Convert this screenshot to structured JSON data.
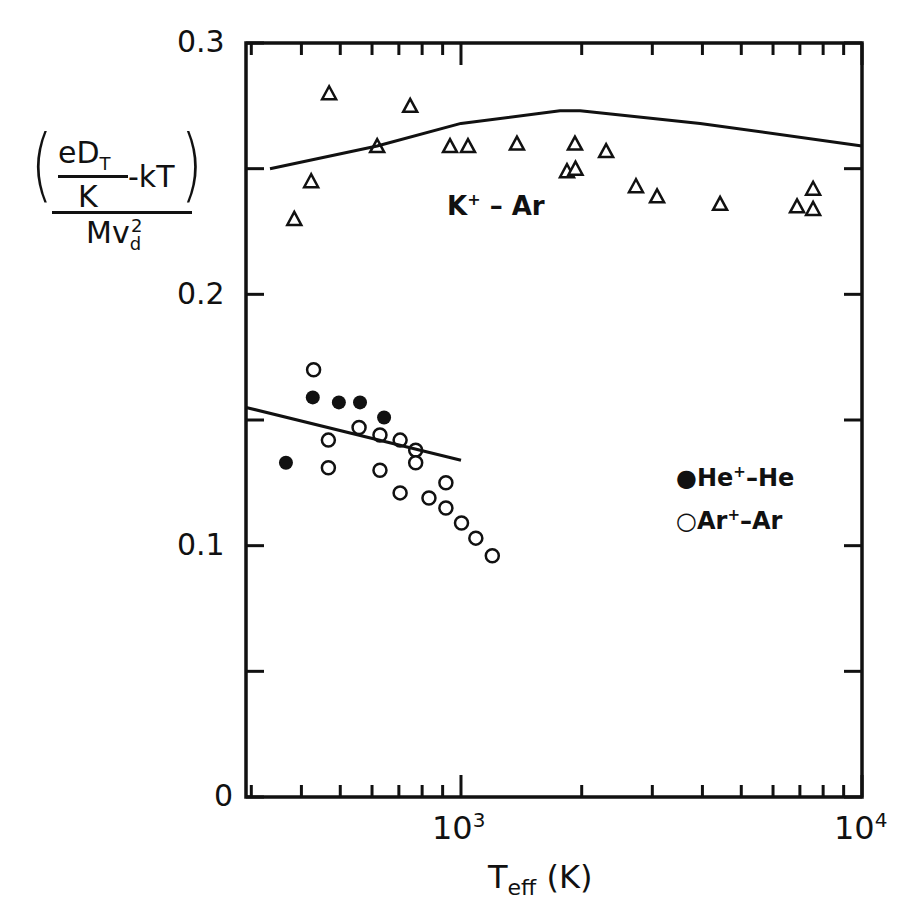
{
  "chart_data": {
    "type": "scatter",
    "title": "",
    "xlabel": "T_eff (K)",
    "ylabel": "(eD_T/K - kT) / (M v_d^2)",
    "xscale": "log",
    "xlim": [
      291,
      10000
    ],
    "ylim": [
      0,
      0.3
    ],
    "x_tick_labels": [
      "10^3",
      "10^4"
    ],
    "y_tick_labels": [
      "0",
      "0.1",
      "0.2",
      "0.3"
    ],
    "grid": false,
    "legend_position": "right-middle",
    "annotations": [
      "K+ - Ar"
    ],
    "series": [
      {
        "name": "K+ - Ar (experiment)",
        "marker": "open-triangle",
        "points": [
          [
            384,
            0.23
          ],
          [
            423,
            0.245
          ],
          [
            469,
            0.28
          ],
          [
            618,
            0.259
          ],
          [
            747,
            0.275
          ],
          [
            939,
            0.259
          ],
          [
            1041,
            0.259
          ],
          [
            1379,
            0.26
          ],
          [
            1838,
            0.249
          ],
          [
            1924,
            0.26
          ],
          [
            1930,
            0.25
          ],
          [
            2301,
            0.257
          ],
          [
            2731,
            0.243
          ],
          [
            3083,
            0.239
          ],
          [
            4427,
            0.236
          ],
          [
            6887,
            0.235
          ],
          [
            7552,
            0.242
          ],
          [
            7552,
            0.234
          ]
        ]
      },
      {
        "name": "K+ - Ar (theory)",
        "marker": "line",
        "points": [
          [
            334,
            0.25
          ],
          [
            618,
            0.259
          ],
          [
            1000,
            0.268
          ],
          [
            1766,
            0.273
          ],
          [
            1982,
            0.273
          ],
          [
            3948,
            0.268
          ],
          [
            10000,
            0.259
          ]
        ]
      },
      {
        "name": "He+ - He",
        "marker": "filled-circle",
        "points": [
          [
            366,
            0.133
          ],
          [
            427,
            0.159
          ],
          [
            496,
            0.157
          ],
          [
            560,
            0.157
          ],
          [
            643,
            0.151
          ]
        ]
      },
      {
        "name": "Ar+ - Ar",
        "marker": "open-circle",
        "points": [
          [
            429,
            0.17
          ],
          [
            467,
            0.142
          ],
          [
            467,
            0.131
          ],
          [
            557,
            0.147
          ],
          [
            628,
            0.144
          ],
          [
            628,
            0.13
          ],
          [
            705,
            0.142
          ],
          [
            771,
            0.138
          ],
          [
            771,
            0.133
          ],
          [
            705,
            0.121
          ],
          [
            832,
            0.119
          ],
          [
            917,
            0.125
          ],
          [
            917,
            0.115
          ],
          [
            1003,
            0.109
          ],
          [
            1089,
            0.103
          ],
          [
            1197,
            0.096
          ]
        ]
      },
      {
        "name": "He+/Ar+ (theory)",
        "marker": "line",
        "points": [
          [
            291,
            0.155
          ],
          [
            1000,
            0.134
          ]
        ]
      }
    ]
  },
  "axes": {
    "y_ticks": [
      "0.3",
      "0.2",
      "0.1",
      "0"
    ],
    "x_ticks": [
      "10",
      "3",
      "10",
      "4"
    ],
    "xlabel_main": "T",
    "xlabel_sub": "eff",
    "xlabel_unit": "(K)"
  },
  "ylabel": {
    "num_e": "eD",
    "num_sub": "T",
    "den_k": "K",
    "minus_kt": "-kT",
    "lparen": "(",
    "rparen": ")",
    "mv": "Mv",
    "mv_sub": "d",
    "mv_sup": "2"
  },
  "annotation": {
    "main": "K",
    "sup": "+",
    "rest": "– Ar"
  },
  "legend": {
    "items": [
      {
        "symbol": "●",
        "label": "He",
        "sup": "+",
        "rest": "–He"
      },
      {
        "symbol": "○",
        "label": "Ar",
        "sup": "+",
        "rest": "–Ar"
      }
    ]
  }
}
